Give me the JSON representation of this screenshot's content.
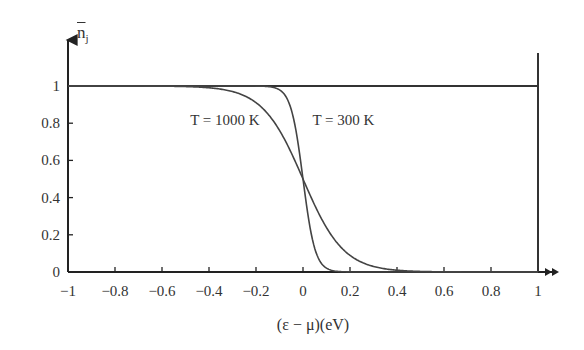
{
  "chart_data": {
    "type": "line",
    "title": "",
    "xlabel": "(ε − μ)(eV)",
    "ylabel": "n̄_j",
    "ylabel_main": "n",
    "ylabel_sub": "j",
    "xlim": [
      -1,
      1
    ],
    "ylim": [
      0,
      1
    ],
    "grid": false,
    "legend": "none (inline annotations)",
    "x_ticks": [
      -1,
      -0.8,
      -0.6,
      -0.4,
      -0.2,
      0,
      0.2,
      0.4,
      0.6,
      0.8,
      1
    ],
    "x_tick_labels": [
      "−1",
      "−0.8",
      "−0.6",
      "−0.4",
      "−0.2",
      "0",
      "0.2",
      "0.4",
      "0.6",
      "0.8",
      "1"
    ],
    "y_ticks": [
      0,
      0.2,
      0.4,
      0.6,
      0.8,
      1
    ],
    "y_tick_labels": [
      "0",
      "0.2",
      "0.4",
      "0.6",
      "0.8",
      "1"
    ],
    "series": [
      {
        "name": "T = 0 K (step)",
        "description": "Horizontal line at n=1 for ε<μ, vertical drop at ε−μ = 1 on the chart frame",
        "x": [
          -1,
          1
        ],
        "values": [
          1,
          1
        ]
      },
      {
        "name": "T = 1000 K",
        "kT_eV": 0.0862,
        "x": [
          -1,
          -0.6,
          -0.4,
          -0.3,
          -0.2,
          -0.1,
          0,
          0.1,
          0.2,
          0.3,
          0.4,
          0.6,
          1
        ],
        "values": [
          1.0,
          0.999,
          0.99,
          0.97,
          0.91,
          0.76,
          0.5,
          0.24,
          0.09,
          0.03,
          0.01,
          0.001,
          0.0
        ]
      },
      {
        "name": "T = 300 K",
        "kT_eV": 0.0259,
        "x": [
          -1,
          -0.2,
          -0.1,
          -0.05,
          0,
          0.05,
          0.1,
          0.2,
          1
        ],
        "values": [
          1.0,
          1.0,
          0.98,
          0.87,
          0.5,
          0.13,
          0.02,
          0.0,
          0.0
        ]
      }
    ],
    "annotations": [
      {
        "text": "T = 1000 K",
        "x": -0.48,
        "y": 0.79
      },
      {
        "text": "T = 300 K",
        "x": 0.04,
        "y": 0.79
      }
    ]
  }
}
